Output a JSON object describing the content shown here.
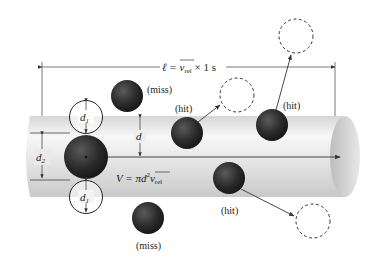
{
  "figure": {
    "length_label": {
      "prefix": "ℓ = ",
      "vbar": "v",
      "vbar_sub": "rel",
      "suffix": " × 1 s"
    },
    "volume_label": {
      "prefix": "V = πd",
      "exp": "2",
      "vbar": "v",
      "vbar_sub": "rel"
    },
    "dimension_labels": {
      "d1_top": "d",
      "d1_top_sub": "1",
      "d1_bottom": "d",
      "d1_bottom_sub": "1",
      "d2": "d",
      "d2_sub": "2",
      "d": "d"
    },
    "molecule_labels": [
      {
        "id": "miss-top",
        "text": "(miss)"
      },
      {
        "id": "hit-1",
        "text": "(hit)"
      },
      {
        "id": "hit-2",
        "text": "(hit)"
      },
      {
        "id": "hit-3",
        "text": "(hit)"
      },
      {
        "id": "miss-bottom",
        "text": "(miss)"
      }
    ],
    "colors": {
      "molecule": "#2b2b2b",
      "cylinder_light": "#f4f4f4",
      "cylinder_dark": "#cfcfcf",
      "line": "#333333"
    }
  }
}
